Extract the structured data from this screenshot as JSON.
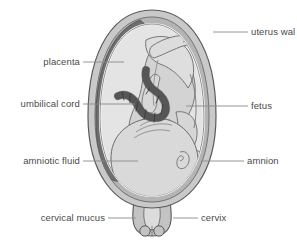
{
  "figure": {
    "background_color": "#ffffff",
    "caption_clipped": "",
    "colors": {
      "uterus_wall_outer": "#c9c9c9",
      "uterus_wall_inner": "#b0b0b0",
      "placenta": "#6e6e6e",
      "umbilical_cord": "#5f5f5f",
      "amniotic_fluid": "#e2e2e2",
      "fetus": "#d3d3d3",
      "amnion_line": "#ffffff",
      "outline": "#555555",
      "leader_line": "#8a8a8a",
      "label_text": "#4a4a4a"
    }
  },
  "labels": {
    "uterus_wall": "uterus wal",
    "fetus": "fetus",
    "amnion": "amnion",
    "cervix": "cervix",
    "placenta": "placenta",
    "umbilical_cord": "umbilical cord",
    "amniotic_fluid": "amniotic fluid",
    "cervical_mucus": "cervical mucus"
  },
  "parts": [
    {
      "id": "uterus-wall",
      "label": "uterus wal",
      "side": "right"
    },
    {
      "id": "fetus",
      "label": "fetus",
      "side": "right"
    },
    {
      "id": "amnion",
      "label": "amnion",
      "side": "right"
    },
    {
      "id": "cervix",
      "label": "cervix",
      "side": "right"
    },
    {
      "id": "placenta",
      "label": "placenta",
      "side": "left"
    },
    {
      "id": "umbilical-cord",
      "label": "umbilical cord",
      "side": "left"
    },
    {
      "id": "amniotic-fluid",
      "label": "amniotic fluid",
      "side": "left"
    },
    {
      "id": "cervical-mucus",
      "label": "cervical mucus",
      "side": "left"
    }
  ]
}
